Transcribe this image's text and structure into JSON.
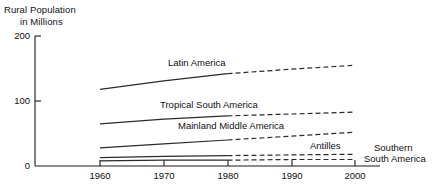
{
  "chart_data": {
    "type": "line",
    "title": "",
    "ylabel": "Rural Population in Millions",
    "ylabel_line1": "Rural Population",
    "ylabel_line2": "in Millions",
    "xlabel": "",
    "x": [
      1960,
      1970,
      1980,
      1990,
      2000
    ],
    "xtick_labels": [
      "1960",
      "1970",
      "1980",
      "1990",
      "2000"
    ],
    "ytick_labels": [
      "0",
      "100",
      "200"
    ],
    "yticks": [
      0,
      100,
      200
    ],
    "ylim": [
      0,
      200
    ],
    "xlim": [
      1960,
      2000
    ],
    "grid": false,
    "legend": "inline-labels",
    "note": "Solid segments 1960-1980 are observed; dashed segments 1980-2000 are projected.",
    "series": [
      {
        "name": "Latin America",
        "label": "Latin America",
        "values": [
          118,
          131,
          142,
          149,
          155
        ],
        "solid_until": 1980
      },
      {
        "name": "Tropical South America",
        "label": "Tropical South America",
        "values": [
          65,
          72,
          77,
          80,
          83
        ],
        "solid_until": 1980
      },
      {
        "name": "Mainland Middle America",
        "label": "Mainland Middle America",
        "values": [
          28,
          34,
          40,
          46,
          52
        ],
        "solid_until": 1980
      },
      {
        "name": "Antilles",
        "label": "Antilles",
        "values": [
          13,
          15,
          16,
          17,
          18
        ],
        "solid_until": 1980
      },
      {
        "name": "Southern South America",
        "label": "Southern\nSouth America",
        "label_line1": "Southern",
        "label_line2": "South America",
        "values": [
          8,
          9,
          9,
          10,
          10
        ],
        "solid_until": 1980
      }
    ],
    "colors": {
      "axis": "#1a1a1a",
      "line": "#2b2b2b",
      "background": "#ffffff"
    }
  }
}
